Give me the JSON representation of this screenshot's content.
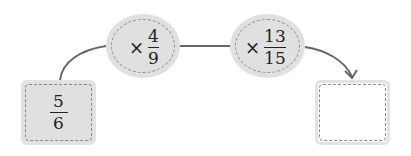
{
  "start": {
    "numerator": "5",
    "denominator": "6",
    "fill": "#e0e0e0"
  },
  "steps": [
    {
      "operator": "×",
      "numerator": "4",
      "denominator": "9"
    },
    {
      "operator": "×",
      "numerator": "13",
      "denominator": "15"
    }
  ],
  "result": {
    "value": ""
  },
  "colors": {
    "connector": "#666666",
    "node_fill": "#e0e0e0",
    "dash": "#8a8a8a"
  }
}
